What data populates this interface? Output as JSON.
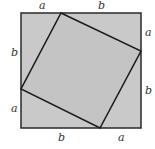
{
  "diagram": {
    "colors": {
      "fill": "#c9c9c9",
      "stroke": "#2a2a2a",
      "background": "#ffffff"
    },
    "outer_square": {
      "x": 21,
      "y": 13,
      "size": 120
    },
    "inner_square": {
      "points": "61,13 141,51 100,128 21,89"
    },
    "labels": {
      "top_a": "a",
      "top_b": "b",
      "right_a": "a",
      "right_b": "b",
      "bottom_b": "b",
      "bottom_a": "a",
      "left_b": "b",
      "left_a": "a"
    }
  }
}
